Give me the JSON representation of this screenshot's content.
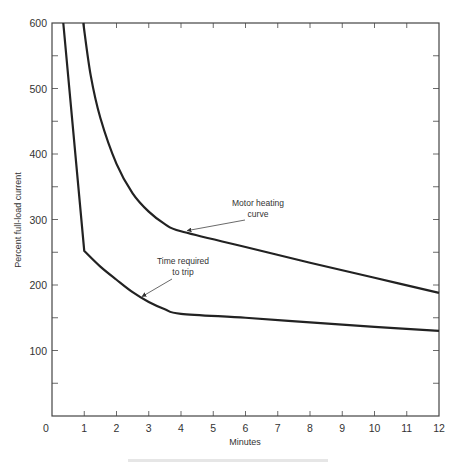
{
  "chart_data": {
    "type": "line",
    "title": "",
    "xlabel": "Minutes",
    "ylabel": "Percent full-load current",
    "xlim": [
      0,
      12
    ],
    "ylim": [
      0,
      600
    ],
    "x_ticks": [
      0,
      1,
      2,
      3,
      4,
      5,
      6,
      7,
      8,
      9,
      10,
      11,
      12
    ],
    "y_ticks": [
      100,
      200,
      300,
      400,
      500,
      600
    ],
    "y_minor_step": 50,
    "grid": false,
    "legend": "none (curves labeled by annotations)",
    "series": [
      {
        "name": "Motor heating curve",
        "x": [
          0.97,
          1.2,
          1.5,
          2.0,
          2.5,
          3.0,
          3.5,
          4.0,
          6.0,
          8.0,
          10.0,
          12.0
        ],
        "y": [
          600,
          520,
          455,
          385,
          340,
          312,
          293,
          282,
          258,
          234,
          211,
          188
        ]
      },
      {
        "name": "Time required to trip",
        "x": [
          0.35,
          1.0,
          1.5,
          2.0,
          2.5,
          3.0,
          3.5,
          4.0,
          6.0,
          8.0,
          10.0,
          12.0
        ],
        "y": [
          600,
          252,
          228,
          208,
          189,
          174,
          163,
          156,
          150,
          143,
          136,
          130
        ]
      }
    ],
    "annotations": [
      {
        "text_lines": [
          "Motor heating",
          "curve"
        ],
        "points_to_series": 0,
        "target": [
          4.2,
          280
        ]
      },
      {
        "text_lines": [
          "Time required",
          "to trip"
        ],
        "points_to_series": 1,
        "target": [
          2.8,
          178
        ]
      }
    ],
    "caption": "(figure caption cut off at bottom edge, illegible)"
  },
  "labels": {
    "xlabel": "Minutes",
    "ylabel": "Percent full-load current",
    "annot_motor_1": "Motor heating",
    "annot_motor_2": "curve",
    "annot_trip_1": "Time required",
    "annot_trip_2": "to trip"
  }
}
